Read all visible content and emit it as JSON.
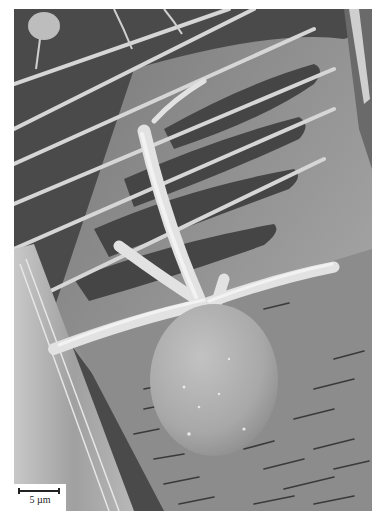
{
  "figure": {
    "colors": {
      "background_page": "#ffffff",
      "dark_substrate": "#4a4a4a",
      "mid_surface": "#8a8a8a",
      "light_structure": "#d8d8d8",
      "highlight": "#eeeeee"
    }
  },
  "scale_bar": {
    "label": "5 µm",
    "value": 5,
    "unit": "µm"
  }
}
